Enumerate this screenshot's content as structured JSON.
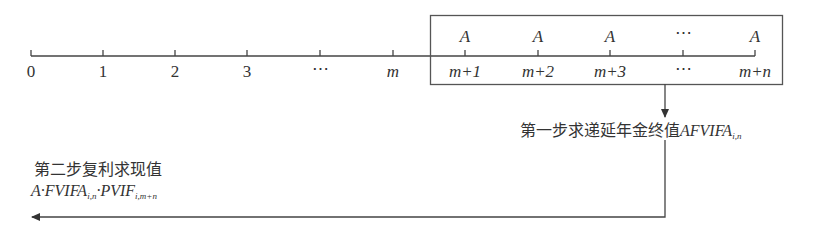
{
  "diagram": {
    "timeline": {
      "periods": [
        "0",
        "1",
        "2",
        "3",
        "⋯",
        "m",
        "m+1",
        "m+2",
        "m+3",
        "⋯",
        "m+n"
      ],
      "tick_x": [
        31,
        103,
        175,
        247,
        320,
        393,
        465,
        538,
        610,
        683,
        755
      ],
      "payments_in_box": [
        "A",
        "A",
        "A",
        "⋯",
        "A"
      ]
    },
    "step1": {
      "text": "第一步求递延年金终值",
      "formula": "AFVIFA",
      "subscript": "i,n"
    },
    "step2": {
      "text": "第二步复利求现值",
      "formula_parts": [
        "A·FVIFA",
        "i,n",
        "·PVIF",
        "i,m+n"
      ]
    }
  }
}
